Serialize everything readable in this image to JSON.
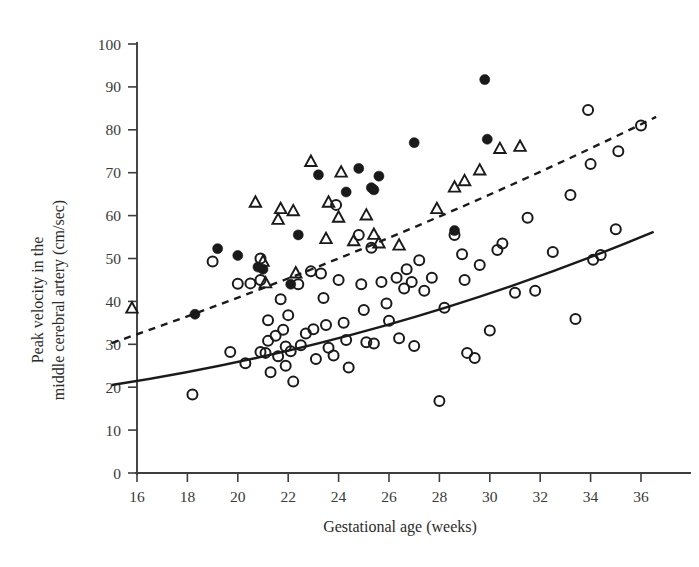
{
  "chart_data": {
    "type": "scatter",
    "title": "",
    "xlabel": "Gestational age (weeks)",
    "ylabel": "Peak velocity in the middle cerebral artery (cm/sec)",
    "ylabel_line1": "Peak velocity in the",
    "ylabel_line2": "middle cerebral artery (cm/sec)",
    "xlim": [
      15,
      36.6
    ],
    "ylim": [
      0,
      100
    ],
    "xticks": [
      16,
      18,
      20,
      22,
      24,
      26,
      28,
      30,
      32,
      34,
      36
    ],
    "yticks": [
      0,
      10,
      20,
      30,
      40,
      50,
      60,
      70,
      80,
      90,
      100
    ],
    "grid": false,
    "legend": "none",
    "marker_color": "#1a1a1a",
    "series": [
      {
        "name": "open-circle",
        "marker": "open circle",
        "points": [
          [
            18.2,
            18.3
          ],
          [
            19.0,
            49.3
          ],
          [
            19.7,
            28.2
          ],
          [
            20.0,
            44.1
          ],
          [
            20.3,
            25.6
          ],
          [
            20.5,
            44.2
          ],
          [
            20.9,
            50.0
          ],
          [
            20.9,
            45.0
          ],
          [
            20.9,
            28.2
          ],
          [
            21.1,
            28.0
          ],
          [
            21.2,
            35.6
          ],
          [
            21.2,
            30.8
          ],
          [
            21.3,
            23.5
          ],
          [
            21.5,
            32.0
          ],
          [
            21.6,
            27.2
          ],
          [
            21.7,
            40.5
          ],
          [
            21.8,
            33.4
          ],
          [
            21.9,
            29.5
          ],
          [
            21.9,
            25.0
          ],
          [
            22.0,
            36.8
          ],
          [
            22.1,
            28.4
          ],
          [
            22.2,
            21.3
          ],
          [
            22.4,
            44.0
          ],
          [
            22.5,
            29.8
          ],
          [
            22.7,
            32.5
          ],
          [
            22.9,
            47.0
          ],
          [
            23.0,
            33.5
          ],
          [
            23.1,
            26.6
          ],
          [
            23.3,
            46.5
          ],
          [
            23.4,
            40.8
          ],
          [
            23.5,
            34.5
          ],
          [
            23.6,
            29.2
          ],
          [
            23.8,
            27.4
          ],
          [
            23.9,
            62.5
          ],
          [
            24.0,
            45.0
          ],
          [
            24.2,
            35.0
          ],
          [
            24.3,
            31.0
          ],
          [
            24.4,
            24.6
          ],
          [
            24.8,
            55.5
          ],
          [
            24.9,
            44.0
          ],
          [
            25.0,
            38.0
          ],
          [
            25.1,
            30.5
          ],
          [
            25.3,
            52.5
          ],
          [
            25.4,
            30.2
          ],
          [
            25.7,
            44.5
          ],
          [
            25.9,
            39.5
          ],
          [
            26.0,
            35.5
          ],
          [
            26.3,
            45.5
          ],
          [
            26.4,
            31.4
          ],
          [
            26.6,
            43.0
          ],
          [
            26.7,
            47.5
          ],
          [
            26.9,
            44.5
          ],
          [
            27.0,
            29.6
          ],
          [
            27.2,
            49.6
          ],
          [
            27.4,
            42.5
          ],
          [
            27.7,
            45.5
          ],
          [
            28.0,
            16.8
          ],
          [
            28.2,
            38.5
          ],
          [
            28.6,
            55.5
          ],
          [
            28.9,
            51.0
          ],
          [
            29.0,
            45.0
          ],
          [
            29.1,
            28.0
          ],
          [
            29.4,
            26.8
          ],
          [
            29.6,
            48.5
          ],
          [
            30.0,
            33.2
          ],
          [
            30.3,
            52.0
          ],
          [
            30.5,
            53.5
          ],
          [
            31.0,
            42.0
          ],
          [
            31.5,
            59.5
          ],
          [
            31.8,
            42.5
          ],
          [
            32.5,
            51.5
          ],
          [
            33.2,
            64.8
          ],
          [
            33.4,
            35.9
          ],
          [
            33.9,
            84.6
          ],
          [
            34.0,
            72.0
          ],
          [
            34.1,
            49.7
          ],
          [
            34.4,
            50.8
          ],
          [
            35.0,
            56.8
          ],
          [
            35.1,
            75.0
          ],
          [
            36.0,
            81.0
          ]
        ]
      },
      {
        "name": "filled-circle",
        "marker": "filled circle",
        "points": [
          [
            18.3,
            37.0
          ],
          [
            19.2,
            52.3
          ],
          [
            20.0,
            50.7
          ],
          [
            20.8,
            48.0
          ],
          [
            21.0,
            47.5
          ],
          [
            22.1,
            44.0
          ],
          [
            22.4,
            55.5
          ],
          [
            23.2,
            69.5
          ],
          [
            24.3,
            65.5
          ],
          [
            24.8,
            71.0
          ],
          [
            25.3,
            66.5
          ],
          [
            25.4,
            66.0
          ],
          [
            25.6,
            69.2
          ],
          [
            27.0,
            77.0
          ],
          [
            28.6,
            56.5
          ],
          [
            29.8,
            91.7
          ],
          [
            29.9,
            77.8
          ]
        ]
      },
      {
        "name": "open-triangle",
        "marker": "open triangle",
        "points": [
          [
            15.8,
            38.3
          ],
          [
            20.7,
            63.0
          ],
          [
            21.0,
            49.2
          ],
          [
            21.1,
            44.2
          ],
          [
            21.6,
            59.0
          ],
          [
            21.7,
            61.5
          ],
          [
            22.2,
            61.0
          ],
          [
            22.3,
            46.5
          ],
          [
            22.9,
            72.5
          ],
          [
            23.5,
            54.5
          ],
          [
            23.6,
            63.0
          ],
          [
            24.0,
            59.5
          ],
          [
            24.1,
            70.0
          ],
          [
            24.6,
            54.0
          ],
          [
            25.1,
            60.0
          ],
          [
            25.4,
            55.5
          ],
          [
            25.6,
            53.5
          ],
          [
            26.4,
            53.0
          ],
          [
            27.9,
            61.5
          ],
          [
            28.6,
            66.5
          ],
          [
            29.0,
            68.0
          ],
          [
            29.6,
            70.5
          ],
          [
            30.4,
            75.5
          ],
          [
            31.2,
            76.0
          ]
        ]
      }
    ],
    "trend_lines": [
      {
        "name": "solid-reference-line",
        "style": "solid",
        "x_start": 15.0,
        "y_start": 20.5,
        "x_end": 36.5,
        "y_end": 56.2,
        "curve_control": [
          26.0,
          30.5
        ]
      },
      {
        "name": "dashed-reference-line",
        "style": "dashed",
        "x_start": 15.0,
        "y_start": 30.3,
        "x_end": 36.6,
        "y_end": 83.0,
        "curve_control": [
          26.0,
          52.5
        ]
      }
    ]
  }
}
